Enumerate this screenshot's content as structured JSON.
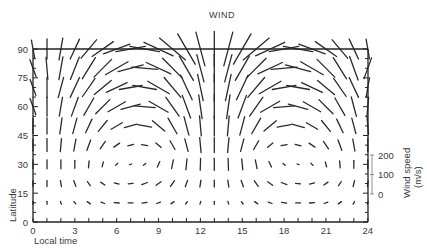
{
  "chart_data": {
    "type": "vector-field",
    "title": "WIND",
    "xlabel": "Local time",
    "ylabel": "Latitude",
    "xlim": [
      0,
      24
    ],
    "ylim": [
      0,
      90
    ],
    "x_ticks": [
      0,
      3,
      6,
      9,
      12,
      15,
      18,
      21,
      24
    ],
    "y_ticks": [
      0,
      15,
      30,
      45,
      60,
      75,
      90
    ],
    "grid": false,
    "scale_bar": {
      "label": "Wind speed",
      "units": "(m/s)",
      "ticks": [
        0,
        100,
        200
      ]
    },
    "vector_grid": {
      "hours": [
        0,
        1,
        2,
        3,
        4,
        5,
        6,
        7,
        8,
        9,
        10,
        11,
        12,
        13,
        14,
        15,
        16,
        17,
        18,
        19,
        20,
        21,
        22,
        23,
        24
      ],
      "latitudes": [
        10,
        20,
        30,
        40,
        50,
        60,
        70,
        80,
        90
      ],
      "note": "each row: [angle_deg (0=north, +clockwise), length_px] per hour 0..24",
      "rows": {
        "10": [
          [
            180,
            3
          ],
          [
            180,
            3
          ],
          [
            160,
            3
          ],
          [
            140,
            3
          ],
          [
            125,
            4
          ],
          [
            110,
            4
          ],
          [
            95,
            5
          ],
          [
            90,
            5
          ],
          [
            80,
            5
          ],
          [
            70,
            4
          ],
          [
            55,
            4
          ],
          [
            35,
            3
          ],
          [
            15,
            3
          ],
          [
            0,
            3
          ],
          [
            -15,
            3
          ],
          [
            -35,
            3
          ],
          [
            -55,
            4
          ],
          [
            -70,
            4
          ],
          [
            -80,
            5
          ],
          [
            -90,
            5
          ],
          [
            -95,
            5
          ],
          [
            -110,
            4
          ],
          [
            -125,
            4
          ],
          [
            -150,
            3
          ],
          [
            -170,
            3
          ]
        ],
        "20": [
          [
            180,
            6
          ],
          [
            180,
            6
          ],
          [
            170,
            6
          ],
          [
            160,
            6
          ],
          [
            145,
            5
          ],
          [
            125,
            5
          ],
          [
            105,
            5
          ],
          [
            85,
            5
          ],
          [
            70,
            6
          ],
          [
            55,
            6
          ],
          [
            35,
            7
          ],
          [
            20,
            7
          ],
          [
            8,
            7
          ],
          [
            0,
            7
          ],
          [
            -8,
            7
          ],
          [
            -20,
            7
          ],
          [
            -35,
            7
          ],
          [
            -55,
            6
          ],
          [
            -70,
            6
          ],
          [
            -85,
            5
          ],
          [
            -105,
            5
          ],
          [
            -125,
            5
          ],
          [
            -145,
            5
          ],
          [
            -165,
            6
          ],
          [
            -175,
            6
          ]
        ],
        "30": [
          [
            0,
            9
          ],
          [
            0,
            9
          ],
          [
            0,
            9
          ],
          [
            0,
            8
          ],
          [
            5,
            7
          ],
          [
            15,
            5
          ],
          [
            45,
            3
          ],
          [
            70,
            2
          ],
          [
            50,
            3
          ],
          [
            25,
            6
          ],
          [
            12,
            9
          ],
          [
            6,
            11
          ],
          [
            2,
            12
          ],
          [
            0,
            12
          ],
          [
            -2,
            12
          ],
          [
            -6,
            11
          ],
          [
            -12,
            9
          ],
          [
            -25,
            6
          ],
          [
            -50,
            3
          ],
          [
            -70,
            2
          ],
          [
            -45,
            3
          ],
          [
            -15,
            5
          ],
          [
            -5,
            7
          ],
          [
            0,
            8
          ],
          [
            0,
            9
          ]
        ],
        "40": [
          [
            0,
            12
          ],
          [
            0,
            13
          ],
          [
            5,
            13
          ],
          [
            10,
            12
          ],
          [
            20,
            11
          ],
          [
            35,
            9
          ],
          [
            55,
            7
          ],
          [
            75,
            6
          ],
          [
            100,
            6
          ],
          [
            130,
            7
          ],
          [
            150,
            10
          ],
          [
            165,
            13
          ],
          [
            175,
            15
          ],
          [
            180,
            15
          ],
          [
            -175,
            15
          ],
          [
            -165,
            13
          ],
          [
            -150,
            10
          ],
          [
            -130,
            7
          ],
          [
            -100,
            6
          ],
          [
            -75,
            6
          ],
          [
            -55,
            7
          ],
          [
            -35,
            9
          ],
          [
            -20,
            11
          ],
          [
            -10,
            12
          ],
          [
            0,
            13
          ]
        ],
        "50": [
          [
            0,
            15
          ],
          [
            0,
            16
          ],
          [
            8,
            16
          ],
          [
            15,
            16
          ],
          [
            25,
            15
          ],
          [
            40,
            14
          ],
          [
            60,
            13
          ],
          [
            75,
            13
          ],
          [
            100,
            14
          ],
          [
            130,
            16
          ],
          [
            150,
            18
          ],
          [
            165,
            19
          ],
          [
            175,
            20
          ],
          [
            180,
            20
          ],
          [
            -175,
            20
          ],
          [
            -165,
            19
          ],
          [
            -150,
            18
          ],
          [
            -130,
            16
          ],
          [
            -100,
            14
          ],
          [
            -75,
            13
          ],
          [
            -60,
            13
          ],
          [
            -40,
            14
          ],
          [
            -25,
            15
          ],
          [
            -15,
            16
          ],
          [
            -5,
            17
          ]
        ],
        "60": [
          [
            -20,
            17
          ],
          [
            0,
            19
          ],
          [
            10,
            19
          ],
          [
            20,
            20
          ],
          [
            30,
            20
          ],
          [
            45,
            20
          ],
          [
            60,
            20
          ],
          [
            75,
            20
          ],
          [
            95,
            21
          ],
          [
            120,
            22
          ],
          [
            145,
            23
          ],
          [
            160,
            24
          ],
          [
            172,
            24
          ],
          [
            180,
            24
          ],
          [
            -172,
            24
          ],
          [
            -160,
            24
          ],
          [
            -145,
            23
          ],
          [
            -120,
            22
          ],
          [
            -95,
            21
          ],
          [
            -75,
            20
          ],
          [
            -60,
            20
          ],
          [
            -45,
            20
          ],
          [
            -30,
            20
          ],
          [
            -15,
            20
          ],
          [
            5,
            19
          ]
        ],
        "70": [
          [
            -20,
            17
          ],
          [
            0,
            20
          ],
          [
            15,
            21
          ],
          [
            25,
            22
          ],
          [
            35,
            22
          ],
          [
            50,
            22
          ],
          [
            65,
            23
          ],
          [
            80,
            23
          ],
          [
            100,
            24
          ],
          [
            120,
            25
          ],
          [
            140,
            26
          ],
          [
            155,
            27
          ],
          [
            168,
            27
          ],
          [
            180,
            27
          ],
          [
            -168,
            27
          ],
          [
            -155,
            27
          ],
          [
            -140,
            26
          ],
          [
            -120,
            25
          ],
          [
            -100,
            24
          ],
          [
            -80,
            23
          ],
          [
            -65,
            23
          ],
          [
            -50,
            22
          ],
          [
            -35,
            22
          ],
          [
            -25,
            22
          ],
          [
            10,
            20
          ]
        ],
        "80": [
          [
            -20,
            18
          ],
          [
            -5,
            22
          ],
          [
            10,
            23
          ],
          [
            22,
            24
          ],
          [
            32,
            25
          ],
          [
            45,
            25
          ],
          [
            60,
            26
          ],
          [
            75,
            26
          ],
          [
            95,
            26
          ],
          [
            115,
            27
          ],
          [
            135,
            28
          ],
          [
            150,
            28
          ],
          [
            165,
            28
          ],
          [
            180,
            28
          ],
          [
            -165,
            28
          ],
          [
            -150,
            28
          ],
          [
            -135,
            28
          ],
          [
            -115,
            27
          ],
          [
            -95,
            26
          ],
          [
            -75,
            26
          ],
          [
            -60,
            26
          ],
          [
            -45,
            25
          ],
          [
            -32,
            25
          ],
          [
            -20,
            25
          ],
          [
            20,
            22
          ]
        ],
        "90": [
          [
            -10,
            18
          ],
          [
            0,
            20
          ],
          [
            10,
            22
          ],
          [
            25,
            22
          ],
          [
            40,
            24
          ],
          [
            55,
            26
          ],
          [
            70,
            28
          ],
          [
            80,
            30
          ],
          [
            100,
            30
          ],
          [
            115,
            32
          ],
          [
            130,
            34
          ],
          [
            150,
            35
          ],
          [
            165,
            35
          ],
          [
            180,
            35
          ],
          [
            -165,
            35
          ],
          [
            -150,
            35
          ],
          [
            -130,
            34
          ],
          [
            -115,
            32
          ],
          [
            -100,
            30
          ],
          [
            -80,
            30
          ],
          [
            -70,
            28
          ],
          [
            -55,
            26
          ],
          [
            -40,
            24
          ],
          [
            -25,
            22
          ],
          [
            -10,
            20
          ]
        ]
      }
    }
  },
  "layout": {
    "x0": 33,
    "x_per_hour": 13.95,
    "y0": 222,
    "y_per_deg": 1.922,
    "scale_bar_x": 372,
    "scale_px_per_ms": 0.195
  }
}
